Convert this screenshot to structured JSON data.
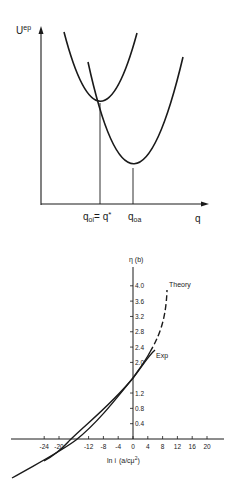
{
  "chart_data": [
    {
      "type": "line",
      "title": "",
      "ylabel": "U^ep",
      "xlabel": "q",
      "series": [
        {
          "name": "initial-state parabola",
          "minimum": {
            "label": "q_oi = q*"
          }
        },
        {
          "name": "final-state parabola",
          "minimum": {
            "label": "q_oa"
          }
        }
      ],
      "annotations": [
        "q_oi = q*",
        "q_oa"
      ],
      "grid": false
    },
    {
      "type": "line",
      "title": "",
      "ylabel": "η (b)",
      "xlabel": "ln i (a/cμ²)",
      "x_ticks": [
        -24,
        -20,
        -12,
        -8,
        -4,
        0,
        4,
        8,
        12,
        16,
        20
      ],
      "y_ticks": [
        0.4,
        0.8,
        1.2,
        2.0,
        2.4,
        2.8,
        3.2,
        3.6,
        4.0
      ],
      "series": [
        {
          "name": "Theory",
          "style": "solid then dashed",
          "x": [
            -32,
            -24,
            -16,
            -8,
            -4,
            0,
            4,
            6,
            8,
            9.5
          ],
          "y": [
            -1.0,
            -0.55,
            -0.05,
            0.55,
            0.95,
            1.4,
            1.95,
            2.4,
            3.2,
            4.0
          ]
        },
        {
          "name": "Exp",
          "style": "solid",
          "x": [
            -32,
            -24,
            -16,
            -8,
            -4,
            0,
            4,
            6
          ],
          "y": [
            -1.0,
            -0.6,
            -0.15,
            0.5,
            0.9,
            1.4,
            1.9,
            2.2
          ]
        }
      ],
      "legend": [
        "Theory",
        "Exp"
      ],
      "ylim": [
        -1.0,
        4.4
      ],
      "xlim": [
        -32,
        24
      ],
      "grid": false
    }
  ],
  "top": {
    "y_label_main": "U",
    "y_label_sup": "ep",
    "x_label": "q",
    "label_qoi": "q",
    "label_qoi_sub": "oi",
    "label_eq": "= q",
    "label_star": "*",
    "label_qoa": "q",
    "label_qoa_sub": "oa"
  },
  "bottom": {
    "y_label": "η (b)",
    "x_label_a": "ln i",
    "x_label_b": "(a/cμ",
    "x_label_sup": "2",
    "x_label_c": ")",
    "theory_label": "Theory",
    "exp_label": "Exp",
    "x_ticks": [
      "-24",
      "-20",
      "-12",
      "-8",
      "-4",
      "0",
      "4",
      "8",
      "12",
      "16",
      "20"
    ],
    "y_ticks": [
      "0.4",
      "0.8",
      "1.2",
      "2.0",
      "2.4",
      "2.8",
      "3.2",
      "3.6",
      "4.0"
    ]
  }
}
